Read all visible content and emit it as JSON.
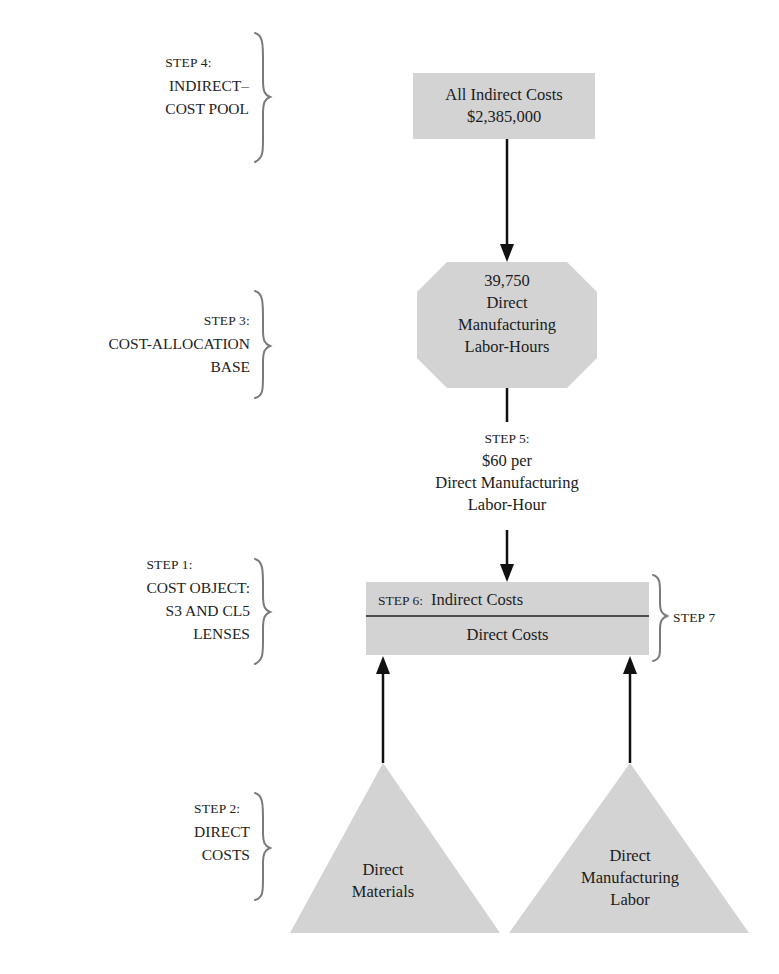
{
  "steps": {
    "step4": {
      "num": "STEP 4:",
      "lines": [
        "INDIRECT–",
        "COST POOL"
      ]
    },
    "step3": {
      "num": "STEP 3:",
      "lines": [
        "COST-ALLOCATION",
        "BASE"
      ]
    },
    "step1": {
      "num": "STEP 1:",
      "lines": [
        "COST OBJECT:",
        "S3 AND CL5",
        "LENSES"
      ]
    },
    "step2": {
      "num": "STEP 2:",
      "lines": [
        "DIRECT",
        "COSTS"
      ]
    },
    "step7": {
      "num": "STEP 7"
    }
  },
  "indirect_pool_box": {
    "title": "All Indirect Costs",
    "amount": "$2,385,000"
  },
  "allocation_base_box": {
    "quantity": "39,750",
    "lines": [
      "Direct",
      "Manufacturing",
      "Labor-Hours"
    ]
  },
  "step5_rate": {
    "num": "STEP 5:",
    "rate": "$60 per",
    "lines": [
      "Direct Manufacturing",
      "Labor-Hour"
    ]
  },
  "cost_object_box": {
    "step6": "STEP 6:",
    "indirect": "Indirect Costs",
    "direct": "Direct Costs"
  },
  "direct_cost_triangles": [
    {
      "lines": [
        "Direct",
        "Materials"
      ]
    },
    {
      "lines": [
        "Direct",
        "Manufacturing",
        "Labor"
      ]
    }
  ],
  "colors": {
    "shape_fill": "#d3d3d3",
    "line": "#111111",
    "brace": "#7a7a7a"
  }
}
